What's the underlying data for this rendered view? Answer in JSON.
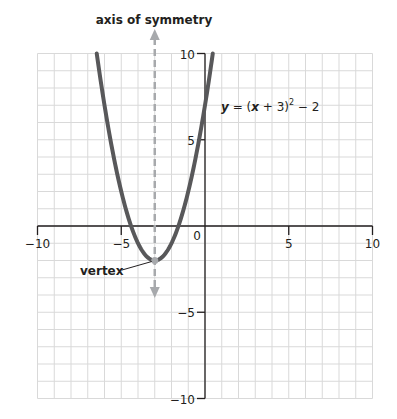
{
  "chart_data": {
    "type": "line",
    "title": "",
    "equation": "y = (x + 3)² − 2",
    "equation_parts": {
      "y": "y",
      "eq": " = (",
      "x": "x",
      "rest": " + 3)",
      "sup": "2",
      "tail": " − 2"
    },
    "xlim": [
      -10,
      10
    ],
    "ylim": [
      -10,
      10
    ],
    "grid": true,
    "x_ticks": [
      -10,
      -5,
      0,
      5,
      10
    ],
    "y_ticks": [
      -10,
      -5,
      5,
      10
    ],
    "x_tick_labels": [
      "−10",
      "−5",
      "0",
      "5",
      "10"
    ],
    "y_tick_labels": [
      "−10",
      "−5",
      "5",
      "10"
    ],
    "series": [
      {
        "name": "y = (x + 3)^2 - 2",
        "function": "(x+3)^2-2",
        "x": [
          -6.46,
          -6,
          -5,
          -4,
          -3,
          -2,
          -1,
          0,
          0.46
        ],
        "values": [
          10,
          7,
          2,
          -1,
          -2,
          -1,
          2,
          7,
          10
        ],
        "color": "#58585a"
      }
    ],
    "vertex": {
      "x": -3,
      "y": -2
    },
    "axis_of_symmetry": {
      "x": -3,
      "color": "#a7a9ac",
      "style": "dashed"
    },
    "annotations": [
      {
        "text": "axis of symmetry",
        "target": "x = -3 dashed line"
      },
      {
        "text": "vertex",
        "target": "(-3, -2)"
      }
    ]
  },
  "labels": {
    "axis_of_symmetry": "axis of symmetry",
    "vertex": "vertex"
  },
  "colors": {
    "curve": "#58585a",
    "axis_symmetry": "#a7a9ac",
    "grid": "#d9d9d9",
    "axes": "#231f20"
  }
}
